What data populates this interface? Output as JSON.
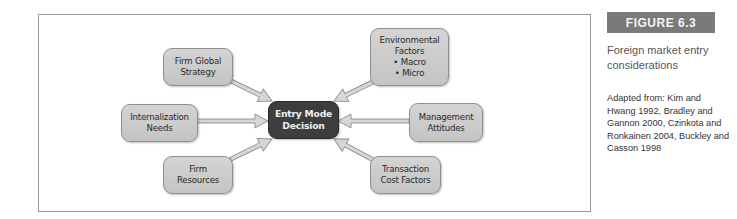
{
  "figure": {
    "label": "FIGURE 6.3",
    "caption": "Foreign market entry considerations",
    "source": "Adapted from: Kim and Hwang 1992, Bradley and Gannon 2000, Czinkota and Ronkainen 2004, Buckley and Casson 1998"
  },
  "diagram": {
    "center": {
      "line1": "Entry Mode",
      "line2": "Decision"
    },
    "nodes": {
      "firm_global_strategy": {
        "line1": "Firm Global",
        "line2": "Strategy"
      },
      "internalization_needs": {
        "line1": "Internalization",
        "line2": "Needs"
      },
      "firm_resources": {
        "line1": "Firm",
        "line2": "Resources"
      },
      "environmental_factors": {
        "line1": "Environmental",
        "line2": "Factors",
        "bullet1": "• Macro",
        "bullet2": "• Micro"
      },
      "management_attitudes": {
        "line1": "Management",
        "line2": "Attitudes"
      },
      "transaction_cost_factors": {
        "line1": "Transaction",
        "line2": "Cost Factors"
      }
    },
    "colors": {
      "node_fill": "#cccccc",
      "center_fill": "#3e3e3e",
      "arrow_fill": "#d6d6d6",
      "arrow_stroke": "#8c8c8c",
      "label_bg": "#7a7a7a"
    }
  }
}
